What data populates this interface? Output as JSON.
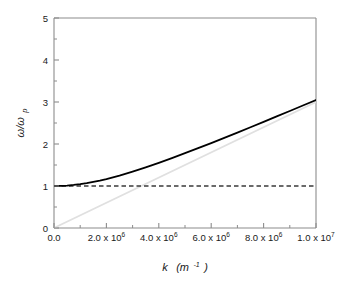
{
  "chart_data": {
    "type": "line",
    "title": "",
    "subtitle": "",
    "xlabel": "k (m-1)",
    "xlabel_symbol": "k",
    "xlabel_unit_base": "(m",
    "xlabel_unit_exp": "-1",
    "xlabel_unit_close": ")",
    "ylabel": "w/wp",
    "ylabel_num": "ω/ω",
    "ylabel_sub": "p",
    "xlim": [
      0,
      10000000
    ],
    "ylim": [
      0,
      5
    ],
    "grid": false,
    "legend": "none",
    "x_ticks": [
      {
        "value": 0,
        "label": "0.0",
        "mantissa": "0.0",
        "exponent": ""
      },
      {
        "value": 2000000,
        "label": "2.0 x 10^6",
        "mantissa": "2.0 x 10",
        "exponent": "6"
      },
      {
        "value": 4000000,
        "label": "4.0 x 10^6",
        "mantissa": "4.0 x 10",
        "exponent": "6"
      },
      {
        "value": 6000000,
        "label": "6.0 x 10^6",
        "mantissa": "6.0 x 10",
        "exponent": "6"
      },
      {
        "value": 8000000,
        "label": "8.0 x 10^6",
        "mantissa": "8.0 x 10",
        "exponent": "6"
      },
      {
        "value": 10000000,
        "label": "1.0 x 10^7",
        "mantissa": "1.0 x 10",
        "exponent": "7"
      }
    ],
    "x_minor_ticks": [
      1000000,
      3000000,
      5000000,
      7000000,
      9000000
    ],
    "y_ticks": [
      {
        "value": 0,
        "label": "0"
      },
      {
        "value": 1,
        "label": "1"
      },
      {
        "value": 2,
        "label": "2"
      },
      {
        "value": 3,
        "label": "3"
      },
      {
        "value": 4,
        "label": "4"
      },
      {
        "value": 5,
        "label": "5"
      }
    ],
    "y_minor_ticks": [
      0.5,
      1.5,
      2.5,
      3.5,
      4.5
    ],
    "series": [
      {
        "name": "dispersion-curve",
        "style": "solid",
        "color": "#000000",
        "width": 1.8,
        "x": [
          0,
          250000,
          500000,
          750000,
          1000000,
          1250000,
          1500000,
          1750000,
          2000000,
          2500000,
          3000000,
          3500000,
          4000000,
          4500000,
          5000000,
          5500000,
          6000000,
          6500000,
          7000000,
          7500000,
          8000000,
          8500000,
          9000000,
          9500000,
          10000000
        ],
        "y": [
          1.0,
          1.003,
          1.011,
          1.025,
          1.044,
          1.068,
          1.097,
          1.129,
          1.166,
          1.249,
          1.343,
          1.444,
          1.552,
          1.664,
          1.781,
          1.9,
          2.022,
          2.146,
          2.272,
          2.399,
          2.527,
          2.656,
          2.786,
          2.917,
          3.048
        ]
      },
      {
        "name": "light-line",
        "style": "solid",
        "color": "#e0e0e0",
        "width": 1.6,
        "x": [
          0,
          10000000
        ],
        "y": [
          0,
          3.0
        ]
      },
      {
        "name": "cutoff-line",
        "style": "dashed",
        "color": "#3a3a3a",
        "width": 1.3,
        "x": [
          0,
          10000000
        ],
        "y": [
          1.0,
          1.0
        ]
      }
    ],
    "annotations": []
  },
  "figure": {
    "background": "#ffffff",
    "frame_color": "#8c8c8c",
    "tick_color": "#8c8c8c"
  }
}
